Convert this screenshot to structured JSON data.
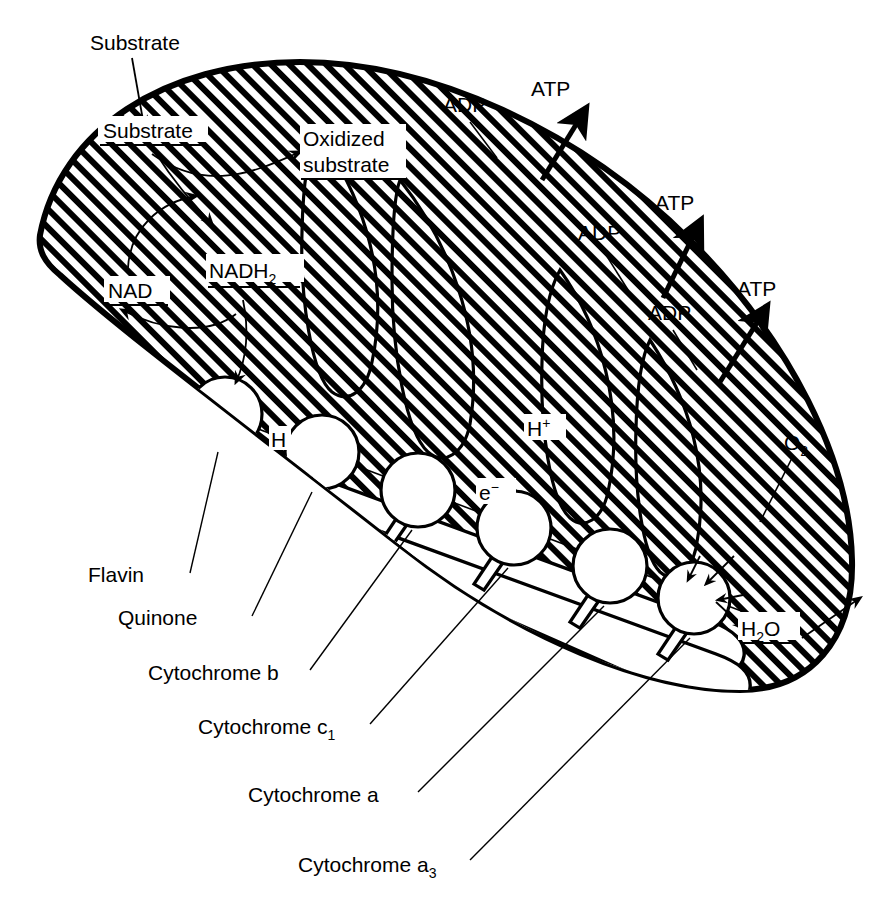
{
  "figure": {
    "type": "biological-schematic-diagram",
    "background_color": "#ffffff",
    "ink_color": "#000000"
  },
  "external_labels": {
    "substrate_in": "Substrate",
    "atp_1": "ATP",
    "atp_2": "ATP",
    "atp_3": "ATP",
    "adp_1": "ADP",
    "adp_2": "ADP",
    "adp_3": "ADP",
    "oxygen": "O",
    "oxygen_sub": "2"
  },
  "internal_labels": {
    "substrate": "Substrate",
    "oxidized_substrate_line1": "Oxidized",
    "oxidized_substrate_line2": "substrate",
    "nad": "NAD",
    "nadh2_base": "NADH",
    "nadh2_sub": "2",
    "hydrogen": "H",
    "proton_base": "H",
    "proton_sup": "+",
    "electron_base": "e",
    "electron_sup": "−",
    "water_base_h": "H",
    "water_sub": "2",
    "water_base_o": "O"
  },
  "carrier_callouts": [
    {
      "name": "Flavin",
      "label": "Flavin",
      "subscript": ""
    },
    {
      "name": "Quinone",
      "label": "Quinone",
      "subscript": ""
    },
    {
      "name": "Cytochrome b",
      "label": "Cytochrome b",
      "subscript": ""
    },
    {
      "name": "Cytochrome c1",
      "label": "Cytochrome c",
      "subscript": "1"
    },
    {
      "name": "Cytochrome a",
      "label": "Cytochrome a",
      "subscript": ""
    },
    {
      "name": "Cytochrome a3",
      "label": "Cytochrome a",
      "subscript": "3"
    }
  ],
  "chain_order": [
    "Flavin",
    "Quinone",
    "Cytochrome b",
    "Cytochrome c1",
    "Cytochrome a",
    "Cytochrome a3"
  ],
  "coupling_sites": 3,
  "notes_on_flow": {
    "substrate_to_oxidized": "Substrate → Oxidized substrate",
    "nad_cycle": "NAD ⇌ NADH2",
    "terminal": "O2 → H2O"
  }
}
